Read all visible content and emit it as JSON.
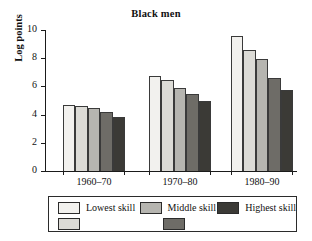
{
  "chart_data": {
    "type": "bar",
    "title": "Black men",
    "xlabel": "",
    "ylabel": "Log points",
    "categories": [
      "1960–70",
      "1970–80",
      "1980–90"
    ],
    "ylim": [
      0,
      10
    ],
    "yticks": [
      0,
      2,
      4,
      6,
      8,
      10
    ],
    "ytick_labels": [
      "0",
      "2",
      "4",
      "6",
      "8",
      "10"
    ],
    "grid": false,
    "legend_position": "bottom",
    "series": [
      {
        "name": "Lowest skill",
        "color": "#f2f1ee",
        "values": [
          4.7,
          6.75,
          9.6
        ]
      },
      {
        "name": "",
        "color": "#dcdbd6",
        "values": [
          4.58,
          6.45,
          8.55
        ]
      },
      {
        "name": "Middle skill",
        "color": "#b6b5b0",
        "values": [
          4.45,
          5.92,
          7.92
        ]
      },
      {
        "name": "",
        "color": "#6e6c67",
        "values": [
          4.22,
          5.45,
          6.62
        ]
      },
      {
        "name": "Highest skill",
        "color": "#3b3a36",
        "values": [
          3.82,
          4.98,
          5.78
        ]
      }
    ],
    "legend_entries": [
      {
        "label": "Lowest skill",
        "color": "#f2f1ee"
      },
      {
        "label": "Middle skill",
        "color": "#b6b5b0"
      },
      {
        "label": "Highest skill",
        "color": "#3b3a36"
      },
      {
        "label": "",
        "color": "#dcdbd6"
      },
      {
        "label": "",
        "color": "#6e6c67"
      }
    ]
  }
}
